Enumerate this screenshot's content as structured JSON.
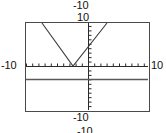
{
  "graph": {
    "title_top_outer": "-10",
    "title_top_inner": "10",
    "label_left": "-10",
    "label_right": "10",
    "label_bottom_inner": "-10",
    "label_bottom_outer": "-10",
    "colors": {
      "frame": "#4a4a4a",
      "axis": "#2b2b2b",
      "curve": "#3a3a3a",
      "line": "#5a5a5a",
      "background": "#ffffff",
      "text": "#111111"
    },
    "frame": {
      "x1": 25,
      "y1": 22,
      "x2": 149,
      "y2": 111
    },
    "axes": {
      "x_axis_y": 66,
      "y_axis_x": 88,
      "tick_spacing_x": 6.2,
      "tick_spacing_y": 4.45,
      "tick_length": 3
    }
  },
  "chart_data": {
    "type": "line",
    "title": "",
    "xlabel": "",
    "ylabel": "",
    "xlim": [
      -10,
      10
    ],
    "ylim": [
      -10,
      10
    ],
    "grid": false,
    "legend": false,
    "axis_tick_labels": {
      "x_min": "-10",
      "x_max": "10",
      "y_max": "10",
      "y_min": "-10"
    },
    "series": [
      {
        "name": "absolute-value-v-curve",
        "type": "line",
        "shape": "v",
        "vertex": [
          -2.4,
          0
        ],
        "points": [
          [
            -7.4,
            10
          ],
          [
            -2.4,
            0
          ],
          [
            0,
            4.8
          ],
          [
            2.9,
            10
          ]
        ],
        "pixel_points": [
          [
            42,
            23
          ],
          [
            73,
            66
          ],
          [
            88,
            45
          ],
          [
            107,
            23
          ]
        ]
      },
      {
        "name": "horizontal-line",
        "type": "line",
        "y": -2.9,
        "points": [
          [
            -10,
            -2.9
          ],
          [
            10,
            -2.9
          ]
        ],
        "pixel_points": [
          [
            26,
            79
          ],
          [
            148,
            79
          ]
        ]
      }
    ]
  }
}
